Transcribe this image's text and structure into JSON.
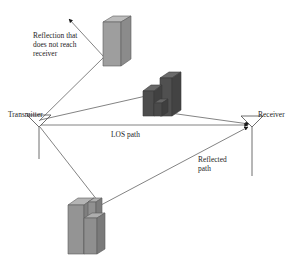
{
  "diagram": {
    "background_color": "#ffffff",
    "line_color": "#4a4a4a",
    "text_color": "#1c1c1c",
    "labels": {
      "reflection_not_reaching": "Reflection that\ndoes not reach\nreceiver",
      "transmitter": "Transmitter",
      "receiver": "Receiver",
      "los_path": "LOS path",
      "reflected_path": "Reflected\npath"
    },
    "nodes": [
      {
        "name": "transmitter-antenna",
        "label": "Transmitter",
        "x": 38,
        "y": 122,
        "mast_bottom_y": 158,
        "type": "dipole-antenna"
      },
      {
        "name": "receiver-antenna",
        "label": "Receiver",
        "x": 252,
        "y": 122,
        "mast_bottom_y": 175,
        "type": "dipole-antenna"
      }
    ],
    "buildings": [
      {
        "name": "building-upper",
        "fill_top": "#b8b8b8",
        "fill_front": "#9b9b9b",
        "fill_side": "#8a8a8a",
        "x": 103,
        "y": 16,
        "width": 18,
        "height": 44,
        "depth": 10
      },
      {
        "name": "building-middle",
        "fill_top": "#6e6e6e",
        "fill_front": "#545454",
        "fill_side": "#474747",
        "x": 143,
        "y": 72,
        "width": 36,
        "height": 44,
        "depth": 10
      },
      {
        "name": "building-lower",
        "fill_top": "#b0b0b0",
        "fill_front": "#8f8f8f",
        "fill_side": "#7d7d7d",
        "x": 68,
        "y": 198,
        "width": 40,
        "height": 56,
        "depth": 10
      }
    ],
    "rays": [
      {
        "name": "ray-los",
        "label": "LOS path",
        "from": "transmitter",
        "to": "receiver",
        "arrowhead": true
      },
      {
        "name": "ray-reflect-upper-building",
        "label": "Reflection that does not reach receiver",
        "from": "transmitter",
        "to": "upper-building",
        "arrowhead": true,
        "escapes": true
      },
      {
        "name": "ray-reflect-middle-building",
        "label": "Reflected path via middle building",
        "from": "transmitter",
        "to": "receiver",
        "via": "middle-building",
        "arrowhead": true
      },
      {
        "name": "ray-reflect-lower-building",
        "label": "Reflected path",
        "from": "transmitter",
        "to": "receiver",
        "via": "lower-building",
        "arrowhead": true
      }
    ]
  }
}
